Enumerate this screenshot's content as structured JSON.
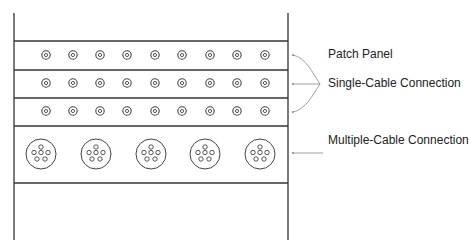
{
  "diagram": {
    "title": "",
    "labels": {
      "patch_panel": "Patch Panel",
      "single_cable": "Single-Cable Connection",
      "multiple_cable": "Multiple-Cable Connection"
    },
    "frame": {
      "left_x": 14,
      "right_x": 288,
      "top_y": 13,
      "bottom_y": 240
    },
    "dividers_y": [
      41,
      70,
      98,
      126,
      183
    ],
    "single_cable_rows": [
      {
        "y": 55,
        "count": 9
      },
      {
        "y": 83,
        "count": 9
      },
      {
        "y": 111,
        "count": 9
      }
    ],
    "single_cable_x": [
      46,
      73,
      100,
      127,
      155,
      182,
      210,
      237,
      265
    ],
    "multiple_cable_row": {
      "y": 154,
      "count": 5,
      "x": [
        41,
        96,
        151,
        205,
        260
      ],
      "pins_per_connector": 6
    },
    "colors": {
      "line": "#333333",
      "arrow": "#888888",
      "text": "#222222"
    }
  }
}
